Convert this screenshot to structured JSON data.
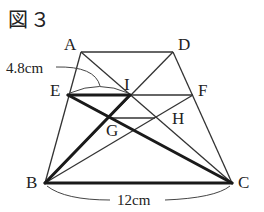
{
  "figure": {
    "title": "図３"
  },
  "points": {
    "A": {
      "label": "A",
      "x": 81,
      "y": 52
    },
    "D": {
      "label": "D",
      "x": 173,
      "y": 52
    },
    "E": {
      "label": "E",
      "x": 68,
      "y": 95
    },
    "F": {
      "label": "F",
      "x": 193,
      "y": 95
    },
    "I": {
      "label": "I",
      "x": 130,
      "y": 95
    },
    "G": {
      "label": "G",
      "x": 112,
      "y": 118
    },
    "H": {
      "label": "H",
      "x": 155,
      "y": 118
    },
    "B": {
      "label": "B",
      "x": 45,
      "y": 183
    },
    "C": {
      "label": "C",
      "x": 232,
      "y": 183
    }
  },
  "measurements": {
    "EI": "4.8cm",
    "BC": "12cm"
  },
  "colors": {
    "line": "#222222",
    "thin_line": "#333333"
  }
}
